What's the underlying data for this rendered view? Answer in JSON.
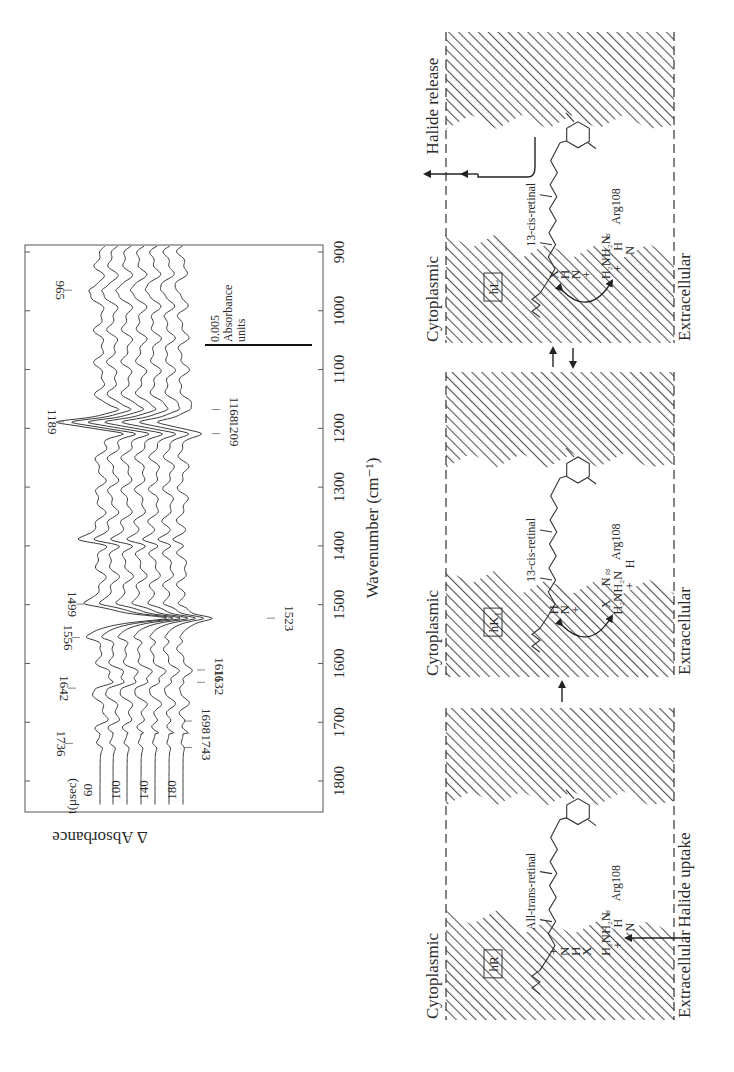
{
  "chart_data": {
    "type": "line",
    "title": "",
    "orientation": "rotated-90",
    "xlabel": "Wavenumber (cm⁻¹)",
    "ylabel": "Δ Absorbance",
    "xlim": [
      1850,
      880
    ],
    "x_ticks": [
      1800,
      1700,
      1600,
      1500,
      1400,
      1300,
      1200,
      1100,
      1000,
      900
    ],
    "x_tick_labels": [
      "1800",
      "1700",
      "1600",
      "1500",
      "1400",
      "1300",
      "1200",
      "1100",
      "1000",
      "900"
    ],
    "grid": false,
    "legend_title": "t(μsec)",
    "series_labels_shown": [
      "60",
      "100",
      "140",
      "180"
    ],
    "series": [
      {
        "name": "60",
        "time_usec": 60
      },
      {
        "name": "80",
        "time_usec": 80
      },
      {
        "name": "100",
        "time_usec": 100
      },
      {
        "name": "120",
        "time_usec": 120
      },
      {
        "name": "140",
        "time_usec": 140
      },
      {
        "name": "160",
        "time_usec": 160
      },
      {
        "name": "180",
        "time_usec": 180
      }
    ],
    "peaks_positive": [
      {
        "wavenumber": 1736,
        "label": "1736"
      },
      {
        "wavenumber": 1642,
        "label": "1642"
      },
      {
        "wavenumber": 1556,
        "label": "1556"
      },
      {
        "wavenumber": 1499,
        "label": "1499"
      },
      {
        "wavenumber": 1189,
        "label": "1189"
      },
      {
        "wavenumber": 965,
        "label": "965"
      }
    ],
    "peaks_negative": [
      {
        "wavenumber": 1743,
        "label": "1743"
      },
      {
        "wavenumber": 1698,
        "label": "1698"
      },
      {
        "wavenumber": 1632,
        "label": "1632"
      },
      {
        "wavenumber": 1611,
        "label": "1611"
      },
      {
        "wavenumber": 1523,
        "label": "1523"
      },
      {
        "wavenumber": 1209,
        "label": "1209"
      },
      {
        "wavenumber": 1168,
        "label": "1168"
      }
    ],
    "scale_bar": {
      "value": 0.005,
      "label_line1": "0.005",
      "label_line2": "Absorbance",
      "label_line3": "units"
    }
  },
  "diagram": {
    "panels": [
      {
        "id": "hR",
        "state_label": "hR",
        "top_label": "Cytoplasmic",
        "bottom_label": "Extracellular",
        "retinal_label": "All-trans-retinal",
        "residue_label": "Arg108",
        "schiff_base_atoms": [
          "+",
          "N",
          "H",
          "X"
        ],
        "arg_atoms": [
          "H₂N",
          "+",
          "N",
          "H₂N",
          "H"
        ],
        "event_label": "Halide uptake"
      },
      {
        "id": "hK1",
        "state_label": "hK",
        "state_subscript": "1",
        "top_label": "Cytoplasmic",
        "bottom_label": "Extracellular",
        "retinal_label": "13-cis-retinal",
        "residue_label": "Arg108",
        "schiff_base_atoms": [
          "H",
          "N",
          "+"
        ],
        "arg_atoms": [
          "X",
          "H₂N",
          "+",
          "N",
          "H₂N",
          "H"
        ]
      },
      {
        "id": "hL",
        "state_label": "hL",
        "top_label": "Cytoplasmic",
        "bottom_label": "Extracellular",
        "retinal_label": "13-cis-retinal",
        "residue_label": "Arg108",
        "schiff_base_atoms": [
          "X",
          "H",
          "N",
          "+"
        ],
        "arg_atoms": [
          "H₂N",
          "+",
          "N",
          "H₂N",
          "H"
        ],
        "event_label": "Halide release"
      }
    ]
  }
}
